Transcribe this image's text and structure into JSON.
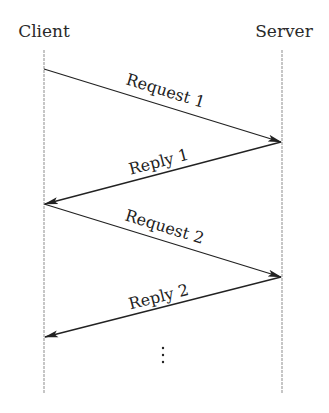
{
  "diagram": {
    "type": "sequence",
    "actors": [
      {
        "id": "client",
        "label": "Client",
        "x": 44,
        "label_x": 44
      },
      {
        "id": "server",
        "label": "Server",
        "x": 282,
        "label_x": 284
      }
    ],
    "lifeline": {
      "top": 50,
      "bottom": 393,
      "color": "#b8b8b8"
    },
    "messages": [
      {
        "label": "Request 1",
        "from": "client",
        "to": "server",
        "y1": 69,
        "y2": 142
      },
      {
        "label": "Reply 1",
        "from": "server",
        "to": "client",
        "y1": 142,
        "y2": 204
      },
      {
        "label": "Request 2",
        "from": "client",
        "to": "server",
        "y1": 204,
        "y2": 277
      },
      {
        "label": "Reply 2",
        "from": "server",
        "to": "client",
        "y1": 277,
        "y2": 337
      }
    ],
    "continuation": {
      "symbol": "vertical-ellipsis",
      "x": 163,
      "ys": [
        348,
        355,
        362
      ]
    },
    "colors": {
      "arrow": "#222222",
      "text": "#2a2a2a",
      "background": "#ffffff"
    }
  }
}
